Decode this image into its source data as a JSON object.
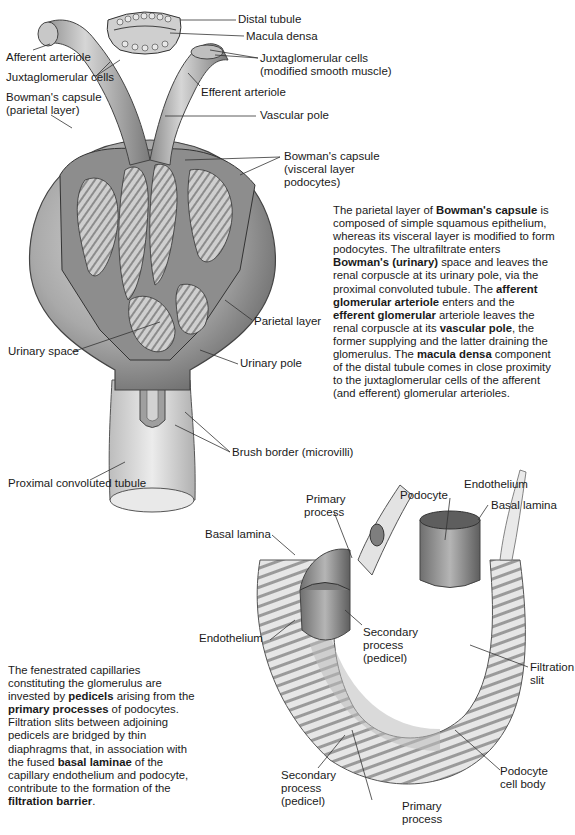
{
  "figure_top": {
    "labels": {
      "distal_tubule": "Distal tubule",
      "macula_densa": "Macula densa",
      "afferent_arteriole": "Afferent arteriole",
      "jg_cells_left": "Juxtaglomerular cells",
      "jg_cells_right_1": "Juxtaglomerular cells",
      "jg_cells_right_2": "(modified smooth muscle)",
      "efferent_arteriole": "Efferent arteriole",
      "bowman_parietal_1": "Bowman's capsule",
      "bowman_parietal_2": "(parietal layer)",
      "vascular_pole": "Vascular pole",
      "bowman_visceral_1": "Bowman's capsule",
      "bowman_visceral_2": "(visceral layer",
      "bowman_visceral_3": "podocytes)",
      "parietal_layer": "Parietal layer",
      "urinary_space": "Urinary space",
      "urinary_pole": "Urinary pole",
      "brush_border": "Brush border (microvilli)",
      "proximal_tubule": "Proximal convoluted tubule"
    },
    "paragraph": [
      {
        "t": "The parietal layer of "
      },
      {
        "b": "Bowman's capsule"
      },
      {
        "t": " is composed of simple squamous epithelium, whereas its visceral layer is modified to form podocytes. The ultrafiltrate enters "
      },
      {
        "b": "Bowman's (urinary)"
      },
      {
        "t": " space and leaves the renal corpuscle at its urinary pole, via the proximal convoluted tubule. The "
      },
      {
        "b": "afferent glomerular arteriole"
      },
      {
        "t": " enters and the "
      },
      {
        "b": "efferent glomerular"
      },
      {
        "t": " arteriole leaves the renal corpuscle at its "
      },
      {
        "b": "vascular pole"
      },
      {
        "t": ", the former supplying and the latter draining the glomerulus. The "
      },
      {
        "b": "macula densa"
      },
      {
        "t": " component of the distal tubule comes in close proximity to the juxtaglomerular cells of the afferent (and efferent) glomerular arterioles."
      }
    ]
  },
  "figure_bottom": {
    "labels": {
      "primary_process_top_1": "Primary",
      "primary_process_top_2": "process",
      "podocyte": "Podocyte",
      "endothelium_top": "Endothelium",
      "basal_lamina_right": "Basal lamina",
      "basal_lamina_left": "Basal lamina",
      "endothelium_left": "Endothelium",
      "secondary_process_mid_1": "Secondary",
      "secondary_process_mid_2": "process",
      "secondary_process_mid_3": "(pedicel)",
      "filtration_slit_1": "Filtration",
      "filtration_slit_2": "slit",
      "secondary_process_bot_1": "Secondary",
      "secondary_process_bot_2": "process",
      "secondary_process_bot_3": "(pedicel)",
      "primary_process_bot_1": "Primary",
      "primary_process_bot_2": "process",
      "podocyte_body_1": "Podocyte",
      "podocyte_body_2": "cell body"
    },
    "paragraph": [
      {
        "t": "The fenestrated capillaries constituting the glomerulus are invested by "
      },
      {
        "b": "pedicels"
      },
      {
        "t": " arising from the "
      },
      {
        "b": "primary processes"
      },
      {
        "t": " of podocytes. Filtration slits between adjoining pedicels are bridged by thin diaphragms that, in association with the fused "
      },
      {
        "b": "basal laminae"
      },
      {
        "t": " of the capillary endothelium and podocyte, contribute to the formation of the "
      },
      {
        "b": "filtration barrier"
      },
      {
        "t": "."
      }
    ]
  },
  "colors": {
    "ink": "#1a1a1a",
    "tissue_dark": "#6e6e6e",
    "tissue_mid": "#a8a8a8",
    "tissue_light": "#dcdcdc",
    "leader": "#333333"
  }
}
